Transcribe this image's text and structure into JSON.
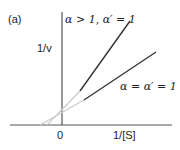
{
  "panel_label": "(a)",
  "y_axis_label": "1/v",
  "x_axis_label": "1/[S]",
  "origin_label": "0",
  "lines": [
    {
      "name": "alpha-gt-1",
      "label": "α > 1, α′ = 1",
      "dark": [
        [
          80,
          91
        ],
        [
          130,
          21
        ]
      ],
      "extension": [
        [
          47,
          125
        ],
        [
          80,
          91
        ]
      ]
    },
    {
      "name": "alpha-eq-1",
      "label": "α = α′ = 1",
      "dark": [
        [
          84,
          100
        ],
        [
          156,
          52
        ]
      ],
      "extension": [
        [
          40,
          125
        ],
        [
          84,
          100
        ]
      ]
    }
  ],
  "colors": {
    "axis": "#555555",
    "line": "#333333",
    "extension": "#cccccc"
  }
}
